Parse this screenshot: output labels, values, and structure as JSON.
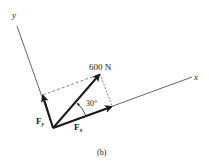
{
  "figure": {
    "caption": "(b)",
    "axes": {
      "x_label": "x",
      "y_label": "y",
      "rotation_deg": 20
    },
    "force": {
      "magnitude_label": "600 N",
      "magnitude": 600,
      "unit": "N",
      "angle_label": "30°",
      "angle_deg": 30
    },
    "components": {
      "fx": {
        "symbol": "F",
        "subscript": "x"
      },
      "fy": {
        "symbol": "F",
        "subscript": "y"
      }
    },
    "colors": {
      "ink": "#1a1a1a",
      "axis": "#555555",
      "dashed": "#666666"
    }
  }
}
